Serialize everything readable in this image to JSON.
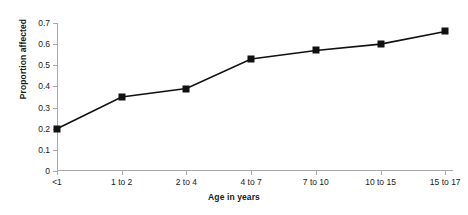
{
  "chart_data": {
    "type": "line",
    "title": "",
    "xlabel": "Age in years",
    "ylabel": "Proportion affected",
    "categories": [
      "<1",
      "1 to 2",
      "2 to 4",
      "4 to 7",
      "7 to 10",
      "10 to 15",
      "15 to 17"
    ],
    "values": [
      0.2,
      0.35,
      0.39,
      0.53,
      0.57,
      0.6,
      0.66
    ],
    "series": [
      {
        "name": "Proportion affected",
        "values": [
          0.2,
          0.35,
          0.39,
          0.53,
          0.57,
          0.6,
          0.66
        ]
      }
    ],
    "ylim": [
      0,
      0.7
    ],
    "yticks": [
      0,
      0.1,
      0.2,
      0.3,
      0.4,
      0.5,
      0.6,
      0.7
    ],
    "ytick_labels": [
      "0",
      "0.1",
      "0.2",
      "0.3",
      "0.4",
      "0.5",
      "0.6",
      "0.7"
    ],
    "grid": false,
    "legend": "none",
    "marker": "square",
    "line_color": "#111111",
    "marker_color": "#111111",
    "axis_color": "#a8a8a8"
  }
}
